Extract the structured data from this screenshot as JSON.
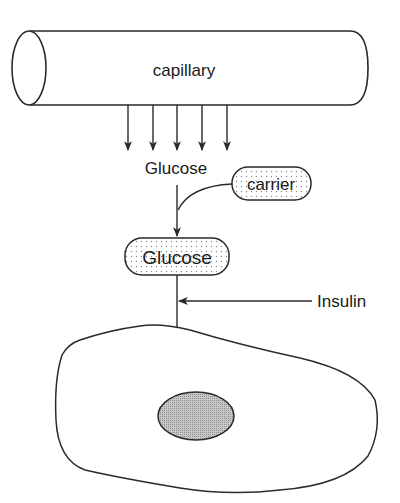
{
  "diagram": {
    "capillary_label": "capillary",
    "glucose_label": "Glucose",
    "carrier_label": "carrier",
    "glucose_complex_label": "Glucose",
    "insulin_label": "Insulin"
  },
  "colors": {
    "stroke": "#2a2a2a",
    "background": "#ffffff",
    "stipple": "#8a8a8a",
    "nucleus_fill": "#b5b5b5"
  }
}
